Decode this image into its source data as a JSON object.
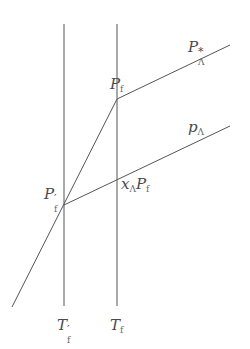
{
  "diagram": {
    "line_color": "#555555",
    "labels": {
      "p_star_lambda": {
        "base": "P",
        "sup": "*",
        "sub": "Λ"
      },
      "p_f": {
        "base": "P",
        "sub": "f"
      },
      "p_lambda": {
        "base": "p",
        "sub": "Λ"
      },
      "x_lambda_p_f": {
        "base1": "x",
        "sub1": "Λ",
        "base2": "P",
        "sub2": "f"
      },
      "p_f_prime": {
        "base": "P",
        "prime": "′",
        "sub": "f"
      },
      "t_f_prime": {
        "base": "T",
        "prime": "′",
        "sub": "f"
      },
      "t_f": {
        "base": "T",
        "sub": "f"
      }
    },
    "lines": [
      {
        "name": "vertical-t-f-prime",
        "x1": 64,
        "y1": 24,
        "x2": 64,
        "y2": 306
      },
      {
        "name": "vertical-t-f",
        "x1": 117,
        "y1": 24,
        "x2": 117,
        "y2": 306
      },
      {
        "name": "steep-line",
        "x1": 12,
        "y1": 307,
        "x2": 117,
        "y2": 99
      },
      {
        "name": "p-star-lambda-line",
        "x1": 117,
        "y1": 99,
        "x2": 230,
        "y2": 45
      },
      {
        "name": "p-lambda-line",
        "x1": 64,
        "y1": 205,
        "x2": 230,
        "y2": 126
      }
    ]
  }
}
